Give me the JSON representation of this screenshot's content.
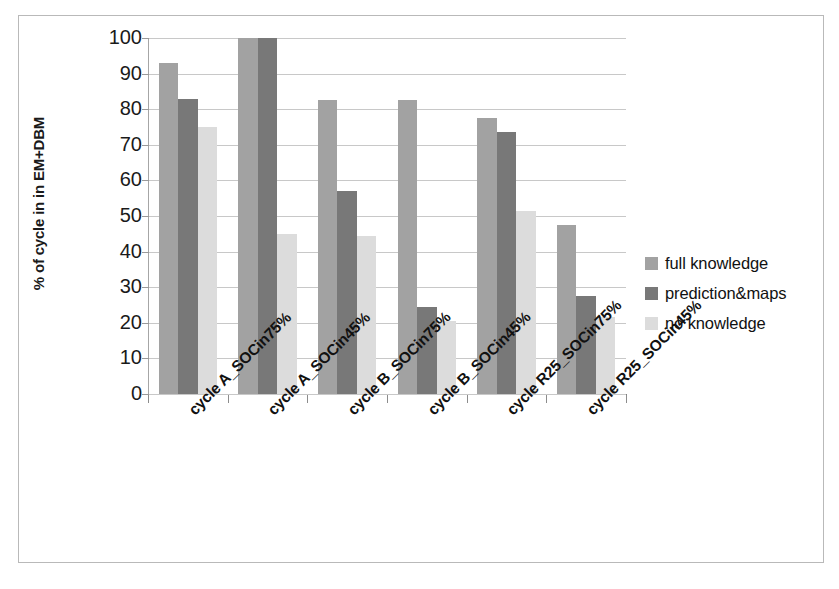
{
  "chart_data": {
    "type": "bar",
    "title": "",
    "subtitle": "",
    "xlabel": "",
    "ylabel": "% of cycle in in EM+DBM",
    "ylim": [
      0,
      100
    ],
    "yticks": [
      0,
      10,
      20,
      30,
      40,
      50,
      60,
      70,
      80,
      90,
      100
    ],
    "grid": true,
    "legend_position": "right",
    "categories": [
      "cycle A_SOCin75%",
      "cycle A_SOCin45%",
      "cycle B_SOCin75%",
      "cycle B_SOCin45%",
      "cycle R25_SOCin75%",
      "cycle R25_SOCin45%"
    ],
    "series": [
      {
        "name": "full knowledge",
        "color": "#a2a2a2",
        "values": [
          93,
          100,
          82.5,
          82.5,
          77.5,
          47.5
        ]
      },
      {
        "name": "prediction&maps",
        "color": "#787878",
        "values": [
          83,
          100,
          57,
          24.5,
          73.5,
          27.5
        ]
      },
      {
        "name": "no knowledge",
        "color": "#dcdcdc",
        "values": [
          75,
          45,
          44.5,
          20.5,
          51.5,
          21.5
        ]
      }
    ]
  },
  "legend": {
    "items": [
      {
        "label": "full knowledge"
      },
      {
        "label": "prediction&maps"
      },
      {
        "label": "no knowledge"
      }
    ]
  },
  "axes": {
    "y_title": "% of cycle in in EM+DBM",
    "y_tick_labels": [
      "100",
      "90",
      "80",
      "70",
      "60",
      "50",
      "40",
      "30",
      "20",
      "10",
      "0"
    ]
  }
}
